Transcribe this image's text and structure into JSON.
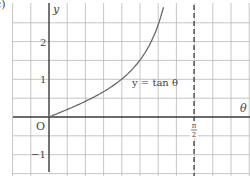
{
  "figure": {
    "part_label": "c)",
    "colors": {
      "background": "#ffffff",
      "grid": "#b8b8b8",
      "axis": "#3a3a3a",
      "curve": "#6a6a6a",
      "asymptote": "#333333"
    }
  },
  "chart_data": {
    "type": "line",
    "title": "",
    "xlabel": "θ",
    "ylabel": "y",
    "origin_label": "O",
    "curve_label": "y = tan θ",
    "function": "tan",
    "x_range": [
      0,
      1.24
    ],
    "ylim": [
      -1.5,
      3.0
    ],
    "xlim": [
      -0.4,
      2.18
    ],
    "y_ticks": [
      {
        "value": 2,
        "label": "2"
      },
      {
        "value": 1,
        "label": "1"
      },
      {
        "value": -1,
        "label": "−1"
      }
    ],
    "x_ticks": [
      {
        "value": 1.5708,
        "label_num": "π",
        "label_den": "2"
      }
    ],
    "asymptote": {
      "x": 1.5708,
      "style": "dashed",
      "label": "π/2"
    },
    "points": [
      {
        "x": 0.0,
        "y": 0.0
      },
      {
        "x": 0.2,
        "y": 0.203
      },
      {
        "x": 0.4,
        "y": 0.423
      },
      {
        "x": 0.6,
        "y": 0.684
      },
      {
        "x": 0.8,
        "y": 1.03
      },
      {
        "x": 1.0,
        "y": 1.557
      },
      {
        "x": 1.1,
        "y": 1.965
      },
      {
        "x": 1.2,
        "y": 2.572
      },
      {
        "x": 1.24,
        "y": 2.912
      }
    ],
    "grid": true,
    "legend": null
  }
}
